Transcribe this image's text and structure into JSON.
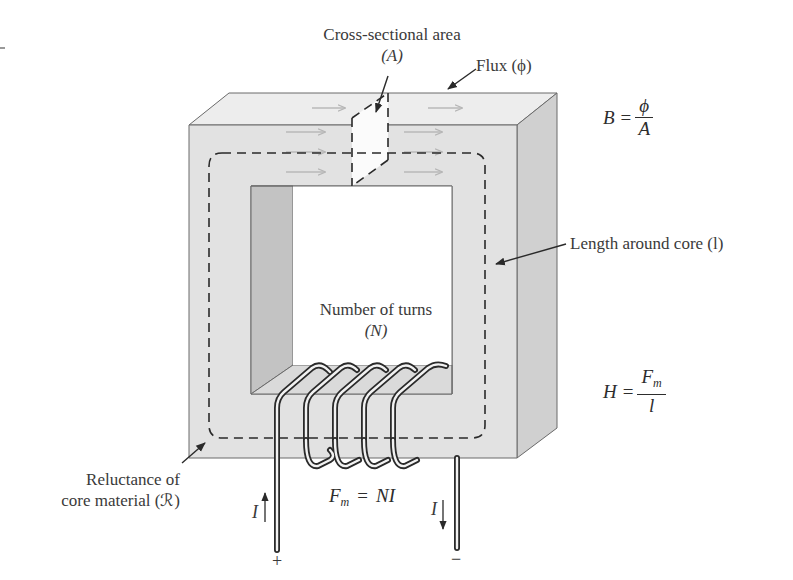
{
  "labels": {
    "cross_section_line1": "Cross-sectional area",
    "cross_section_line2": "(A)",
    "flux": "Flux (ϕ)",
    "length": "Length around core (l)",
    "turns_line1": "Number of turns",
    "turns_line2": "(N)",
    "reluctance_line1": "Reluctance of",
    "reluctance_line2": "core material (ℛ)"
  },
  "equations": {
    "flux_density": {
      "lhs": "B",
      "eq": "=",
      "numerator": "ϕ",
      "denominator": "A"
    },
    "field_intensity": {
      "lhs": "H",
      "eq": "=",
      "numerator": "F",
      "numerator_sub": "m",
      "denominator": "l"
    },
    "mmf": {
      "lhs": "F",
      "lhs_sub": "m",
      "eq": "=",
      "rhs": "NI"
    }
  },
  "terminals": {
    "left_current": "I",
    "right_current": "I",
    "plus": "+",
    "minus": "−"
  },
  "colors": {
    "core_front": "#e3e3e3",
    "core_top": "#ececec",
    "core_side": "#cfcfcf",
    "window_inner_side": "#c4c4c4",
    "outline": "#6a6a6a",
    "dash": "#2a2a2a",
    "flux_arrow": "#b9b9b9"
  }
}
